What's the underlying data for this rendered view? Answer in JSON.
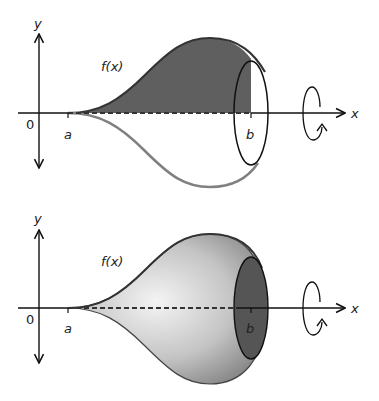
{
  "figure": {
    "colors": {
      "axis": "#111111",
      "curve": "#333333",
      "reflected_curve": "#808080",
      "region_fill": "#5f5f5f",
      "disc_fill": "#555555",
      "solid_light": "#f2f2f2",
      "solid_dark": "#7a7a7a"
    },
    "panels": [
      {
        "id": "top",
        "title": "Region under curve and its reflection",
        "labels": {
          "y_axis": "y",
          "x_axis": "x",
          "origin": "0",
          "a": "a",
          "b": "b",
          "function": "f(x)"
        }
      },
      {
        "id": "bottom",
        "title": "Resulting solid of revolution",
        "labels": {
          "y_axis": "y",
          "x_axis": "x",
          "origin": "0",
          "a": "a",
          "b": "b",
          "function": "f(x)"
        }
      }
    ],
    "icons": [
      "rotation-arrow-icon"
    ]
  }
}
